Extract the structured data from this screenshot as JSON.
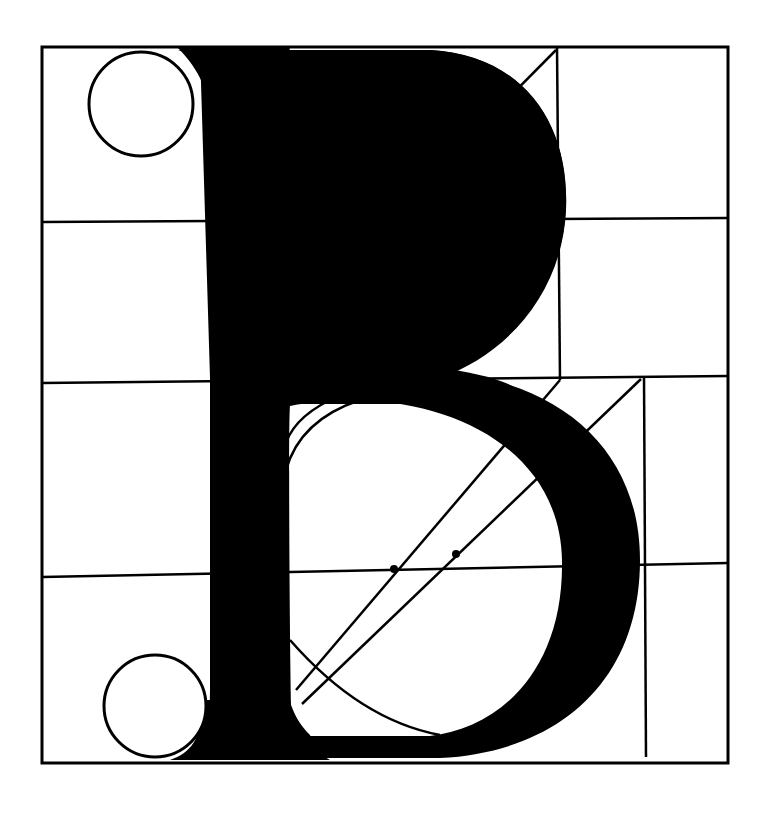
{
  "diagram": {
    "title": "",
    "colors": {
      "ink": "#000000",
      "paper": "#ffffff"
    },
    "frame": {
      "x1": 42,
      "y1": 47,
      "x2": 728,
      "y2": 763
    },
    "grid": {
      "horizontal_lines": [
        {
          "x1": 42,
          "y1": 222,
          "x2": 728,
          "y2": 218
        },
        {
          "x1": 42,
          "y1": 383,
          "x2": 728,
          "y2": 376
        },
        {
          "x1": 42,
          "y1": 577,
          "x2": 728,
          "y2": 563
        }
      ],
      "vertical_lines": [
        {
          "x1": 557,
          "y1": 47,
          "x2": 560,
          "y2": 380
        },
        {
          "x1": 560,
          "y1": 380,
          "x2": 560,
          "y2": 380
        },
        {
          "x1": 644,
          "y1": 376,
          "x2": 646,
          "y2": 757
        }
      ]
    },
    "serif_circles": [
      {
        "cx": 141,
        "cy": 104,
        "r": 52
      },
      {
        "cx": 155,
        "cy": 706,
        "r": 51
      }
    ],
    "construction_dots": [
      {
        "cx": 334,
        "cy": 219,
        "r": 4
      },
      {
        "cx": 395,
        "cy": 219,
        "r": 5
      },
      {
        "cx": 394,
        "cy": 569,
        "r": 4
      },
      {
        "cx": 456,
        "cy": 554,
        "r": 4
      }
    ],
    "diagonals": [
      {
        "x1": 285,
        "y1": 324,
        "x2": 556,
        "y2": 50
      },
      {
        "x1": 296,
        "y1": 690,
        "x2": 560,
        "y2": 380
      },
      {
        "x1": 302,
        "y1": 704,
        "x2": 641,
        "y2": 379
      }
    ],
    "inner_arcs": [
      {
        "d": "M 284 100 Q 300 82 330 78"
      },
      {
        "d": "M 284 335 Q 330 380 400 368"
      },
      {
        "d": "M 286 470 Q 300 420 360 400"
      },
      {
        "d": "M 284 450 Q 290 420 330 400"
      },
      {
        "d": "M 290 640 Q 360 720 440 735"
      }
    ]
  }
}
